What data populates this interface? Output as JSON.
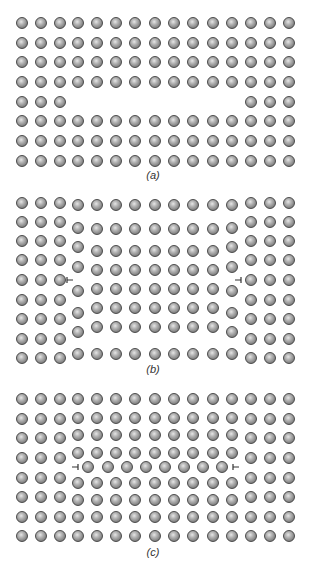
{
  "figure": {
    "colors": {
      "ball_outline": "#4a4a4a",
      "ball_highlight": "#e6e6e6",
      "ball_shadow": "#5c5c5c",
      "symbol": "#333333",
      "background": "#ffffff"
    },
    "panels": [
      {
        "id": "a",
        "label": "(a)",
        "label_pos": [
          153,
          175
        ],
        "description": "vacancy row (missing atoms)",
        "dislocations": []
      },
      {
        "id": "b",
        "label": "(b)",
        "label_pos": [
          153,
          369
        ],
        "description": "edge dislocations after lattice relaxation",
        "dislocations": [
          {
            "x": 70,
            "y": 280,
            "orientation": "left"
          },
          {
            "x": 238,
            "y": 280,
            "orientation": "right"
          }
        ]
      },
      {
        "id": "c",
        "label": "(c)",
        "label_pos": [
          153,
          552
        ],
        "description": "inserted half-row of atoms with edge dislocations",
        "dislocations": [
          {
            "x": 75,
            "y": 467,
            "orientation": "right"
          },
          {
            "x": 236,
            "y": 467,
            "orientation": "left"
          }
        ]
      }
    ],
    "lattice": {
      "columns_x": [
        22,
        41,
        60,
        78,
        97,
        116,
        135,
        155,
        174,
        193,
        213,
        232,
        251,
        270,
        289
      ],
      "panel_a": {
        "rows_y": [
          23,
          43,
          62,
          82,
          102,
          121,
          141,
          161
        ],
        "missing": {
          "row_index": 4,
          "from_col": 3,
          "to_col": 11
        }
      },
      "panel_b": {
        "outer_cols": [
          0,
          1,
          2,
          12,
          13,
          14
        ],
        "outer_rows_y": [
          203,
          222,
          241,
          260,
          280,
          300,
          319,
          339,
          358
        ],
        "edge_cols": [
          3,
          11
        ],
        "edge_rows_y": [
          205,
          228,
          247,
          267,
          291,
          313,
          332,
          354
        ],
        "inner_cols": [
          4,
          5,
          6,
          7,
          8,
          9,
          10
        ],
        "inner_rows_y": [
          205,
          229,
          251,
          270,
          289,
          308,
          327,
          354
        ]
      },
      "panel_c": {
        "outer_cols": [
          0,
          1,
          2,
          12,
          13,
          14
        ],
        "outer_rows_y": [
          399,
          419,
          438,
          458,
          478,
          497,
          517,
          536
        ],
        "inner_cols": [
          3,
          4,
          5,
          6,
          7,
          8,
          9,
          10,
          11
        ],
        "inner_rows_y": [
          399,
          418,
          435,
          453,
          483,
          500,
          517,
          536
        ],
        "inserted_row": {
          "y": 467,
          "x": [
            88,
            108,
            127,
            146,
            165,
            184,
            203,
            222
          ]
        }
      }
    }
  }
}
